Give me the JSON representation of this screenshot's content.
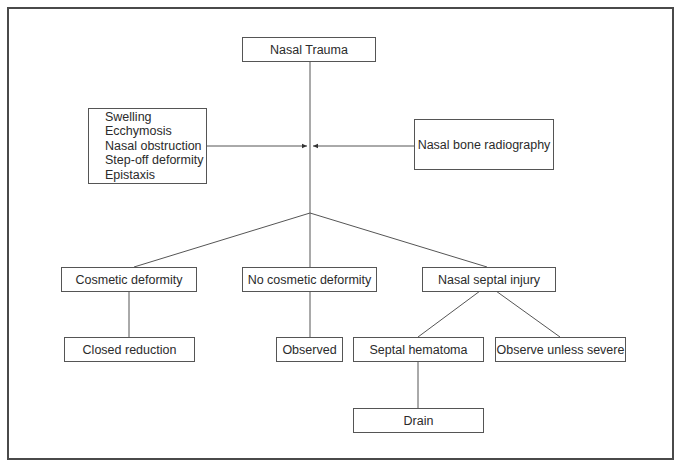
{
  "diagram": {
    "type": "flowchart",
    "root": {
      "id": "nasal-trauma",
      "label": "Nasal Trauma"
    },
    "inputs": {
      "signs": {
        "id": "clinical-signs",
        "items": [
          "Swelling",
          "Ecchymosis",
          "Nasal obstruction",
          "Step-off deformity",
          "Epistaxis"
        ]
      },
      "imaging": {
        "id": "radiography",
        "label": "Nasal bone radiography"
      }
    },
    "branches": [
      {
        "id": "cosmetic-deformity",
        "label": "Cosmetic deformity",
        "children": [
          {
            "id": "closed-reduction",
            "label": "Closed reduction"
          }
        ]
      },
      {
        "id": "no-cosmetic-deformity",
        "label": "No cosmetic deformity",
        "children": [
          {
            "id": "observed",
            "label": "Observed"
          }
        ]
      },
      {
        "id": "nasal-septal-injury",
        "label": "Nasal septal injury",
        "children": [
          {
            "id": "septal-hematoma",
            "label": "Septal hematoma",
            "children": [
              {
                "id": "drain",
                "label": "Drain"
              }
            ]
          },
          {
            "id": "observe-unless-severe",
            "label": "Observe unless severe"
          }
        ]
      }
    ],
    "colors": {
      "line": "#555555",
      "text": "#2b2b2b",
      "frame": "#4a4a4a",
      "background": "#ffffff"
    }
  }
}
